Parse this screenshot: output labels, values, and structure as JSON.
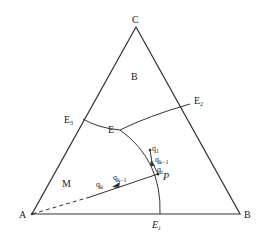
{
  "diagram": {
    "type": "ternary-phase-diagram",
    "vertices": {
      "A": {
        "label": "A"
      },
      "B": {
        "label": "B"
      },
      "C": {
        "label": "C"
      }
    },
    "eutectic_points": {
      "E1": {
        "label": "E",
        "sub": "1"
      },
      "E2": {
        "label": "E",
        "sub": "2"
      },
      "E3": {
        "label": "E",
        "sub": "3"
      },
      "E": {
        "label": "E"
      }
    },
    "regions": {
      "B": {
        "label": "B"
      },
      "M": {
        "label": "M"
      }
    },
    "path_labels": {
      "q1": {
        "label": "q",
        "sub": "1"
      },
      "qk_minus_1": {
        "label": "q",
        "sub": "k−1"
      },
      "qi": {
        "label": "q",
        "sub": "i"
      },
      "qkb_minus_1": {
        "label": "q",
        "sub": "k−1"
      },
      "qk": {
        "label": "q",
        "sub": "k"
      },
      "P": {
        "label": "P"
      }
    },
    "colors": {
      "line": "#333333",
      "text": "#222222",
      "background": "#ffffff"
    }
  }
}
